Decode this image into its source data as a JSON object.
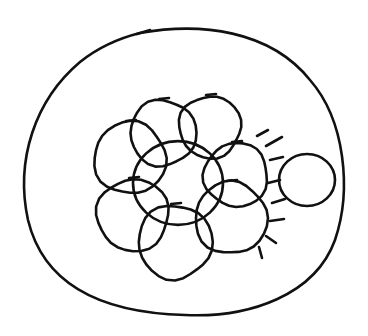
{
  "diagram": {
    "type": "hand-drawn sketch",
    "colors": {
      "background": "#ffffff",
      "stroke": "#111111"
    },
    "outer_boundary": {
      "cx": 184,
      "cy": 172,
      "rx": 162,
      "ry": 143
    },
    "central_circle": {
      "cx": 178,
      "cy": 183,
      "r": 45
    },
    "petal_circles": [
      {
        "name": "top-left",
        "cx": 130,
        "cy": 158,
        "r": 36
      },
      {
        "name": "top",
        "cx": 163,
        "cy": 133,
        "r": 33
      },
      {
        "name": "top-right",
        "cx": 210,
        "cy": 127,
        "r": 31
      },
      {
        "name": "right-upper",
        "cx": 236,
        "cy": 175,
        "r": 32
      },
      {
        "name": "right-lower",
        "cx": 231,
        "cy": 218,
        "r": 36
      },
      {
        "name": "bottom",
        "cx": 175,
        "cy": 242,
        "r": 37
      },
      {
        "name": "bottom-left",
        "cx": 133,
        "cy": 215,
        "r": 36
      }
    ],
    "external_circle": {
      "cx": 307,
      "cy": 180,
      "rx": 28,
      "ry": 26
    },
    "radiating_marks": [
      {
        "x1": 257,
        "y1": 136,
        "x2": 268,
        "y2": 130
      },
      {
        "x1": 266,
        "y1": 146,
        "x2": 282,
        "y2": 137
      },
      {
        "x1": 270,
        "y1": 160,
        "x2": 283,
        "y2": 157
      },
      {
        "x1": 268,
        "y1": 183,
        "x2": 280,
        "y2": 180
      },
      {
        "x1": 272,
        "y1": 203,
        "x2": 285,
        "y2": 199
      },
      {
        "x1": 270,
        "y1": 221,
        "x2": 284,
        "y2": 219
      },
      {
        "x1": 266,
        "y1": 236,
        "x2": 276,
        "y2": 243
      },
      {
        "x1": 259,
        "y1": 247,
        "x2": 262,
        "y2": 258
      }
    ]
  }
}
